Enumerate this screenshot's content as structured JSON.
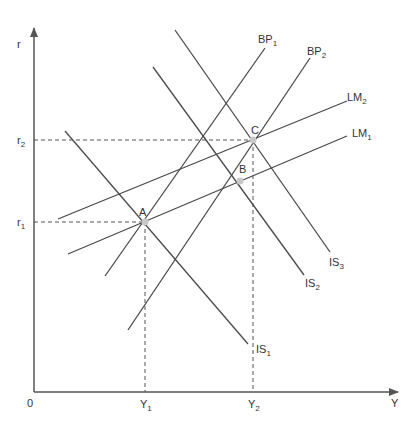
{
  "diagram": {
    "axes": {
      "y_label": "r",
      "x_label": "Y",
      "origin_label": "0",
      "y_ticks": [
        {
          "label": "r",
          "sub": "2",
          "y": 140
        },
        {
          "label": "r",
          "sub": "1",
          "y": 222
        }
      ],
      "x_ticks": [
        {
          "label": "Y",
          "sub": "1",
          "x": 145
        },
        {
          "label": "Y",
          "sub": "2",
          "x": 253
        }
      ]
    },
    "curves": [
      {
        "name": "IS",
        "sub": "1",
        "x1": 65,
        "y1": 131,
        "x2": 248,
        "y2": 344
      },
      {
        "name": "IS",
        "sub": "2",
        "x1": 153,
        "y1": 67,
        "x2": 304,
        "y2": 275
      },
      {
        "name": "IS",
        "sub": "3",
        "x1": 175,
        "y1": 30,
        "x2": 330,
        "y2": 252
      },
      {
        "name": "LM",
        "sub": "1",
        "x1": 68,
        "y1": 254,
        "x2": 347,
        "y2": 136
      },
      {
        "name": "LM",
        "sub": "2",
        "x1": 58,
        "y1": 219,
        "x2": 347,
        "y2": 101
      },
      {
        "name": "BP",
        "sub": "1",
        "x1": 105,
        "y1": 276,
        "x2": 265,
        "y2": 48
      },
      {
        "name": "BP",
        "sub": "2",
        "x1": 128,
        "y1": 330,
        "x2": 310,
        "y2": 58
      }
    ],
    "points": [
      {
        "label": "A",
        "x": 145,
        "y": 222
      },
      {
        "label": "B",
        "x": 240,
        "y": 181
      },
      {
        "label": "C",
        "x": 253,
        "y": 140
      }
    ],
    "colors": {
      "line": "#4a4a4a",
      "axis": "#555555",
      "point": "#c8c8c8",
      "text": "#333333"
    }
  }
}
